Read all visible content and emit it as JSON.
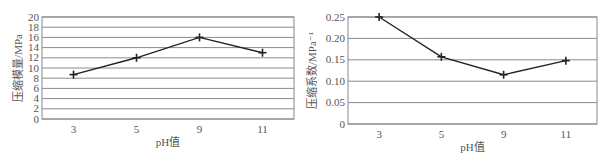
{
  "chart_data": [
    {
      "type": "line",
      "title": "",
      "xlabel": "pH值",
      "ylabel": "压缩模量/MPa",
      "categories": [
        "3",
        "5",
        "9",
        "11"
      ],
      "series": [
        {
          "name": "压缩模量",
          "values": [
            8.7,
            12.0,
            16.0,
            13.0
          ]
        }
      ],
      "ylim": [
        0,
        20
      ],
      "yticks": [
        0,
        2,
        4,
        6,
        8,
        10,
        12,
        14,
        16,
        18,
        20
      ],
      "ytick_labels": [
        "0",
        "2",
        "4",
        "6",
        "8",
        "10",
        "12",
        "14",
        "16",
        "18",
        "20"
      ],
      "grid": true,
      "marker": "plus",
      "legend": null
    },
    {
      "type": "line",
      "title": "",
      "xlabel": "pH值",
      "ylabel": "压缩系数/MPa⁻¹",
      "categories": [
        "3",
        "5",
        "9",
        "11"
      ],
      "series": [
        {
          "name": "压缩系数",
          "values": [
            0.25,
            0.157,
            0.115,
            0.148
          ]
        }
      ],
      "ylim": [
        0,
        0.25
      ],
      "yticks": [
        0,
        0.05,
        0.1,
        0.15,
        0.2,
        0.25
      ],
      "ytick_labels": [
        "0",
        "0.05",
        "0.10",
        "0.15",
        "0.20",
        "0.25"
      ],
      "grid": true,
      "marker": "plus",
      "legend": null
    }
  ],
  "charts": [
    {
      "ylabel": "压缩模量/MPa",
      "xlabel": "pH值"
    },
    {
      "ylabel": "压缩系数/MPa⁻¹",
      "xlabel": "pH值"
    }
  ],
  "colors": {
    "line": "#222222",
    "grid": "#8a8a8a",
    "axis": "#8a8a8a",
    "text": "#555555"
  }
}
